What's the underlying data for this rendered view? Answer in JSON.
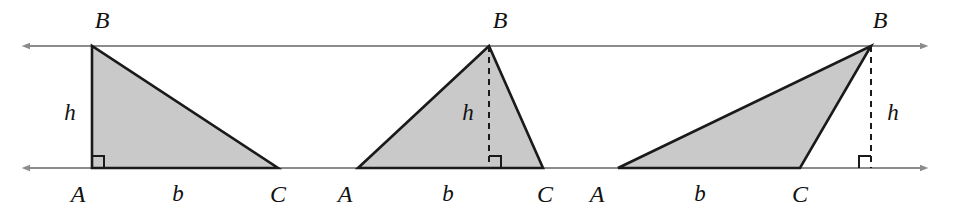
{
  "figure": {
    "width": 967,
    "height": 224,
    "background_color": "#ffffff",
    "parallel_lines": {
      "stroke_color": "#8c8c8c",
      "stroke_width": 2.2,
      "arrow_both_ends": true,
      "top_line_y": 46,
      "bottom_line_y": 168,
      "x_start": 30,
      "x_end": 920
    },
    "triangle_style": {
      "fill_color": "#c9c9c9",
      "stroke_color": "#1a1a1a",
      "stroke_width": 2.6,
      "altitude_dash_color": "#1a1a1a",
      "right_angle_marker_color": "#1a1a1a"
    },
    "triangles": [
      {
        "name": "right-triangle",
        "description": "altitude coincides with side AB, right angle at A",
        "points": "92,168 92,46 278,168",
        "vertices": {
          "A": [
            92,
            168
          ],
          "B": [
            92,
            46
          ],
          "C": [
            278,
            168
          ]
        },
        "altitude": {
          "from": [
            92,
            46
          ],
          "to": [
            92,
            168
          ],
          "dashed": false
        },
        "right_angle_at": [
          92,
          168
        ],
        "labels": {
          "apex": "B",
          "apex_pos": [
            102,
            20
          ],
          "left_base": "A",
          "left_base_pos": [
            78,
            194
          ],
          "base": "b",
          "base_pos": [
            178,
            193
          ],
          "right_base": "C",
          "right_base_pos": [
            278,
            194
          ],
          "height": "h",
          "height_pos": [
            70,
            112
          ]
        }
      },
      {
        "name": "acute-triangle",
        "description": "altitude falls inside the triangle, drawn dashed from B to base AC",
        "points": "358,168 489,46 543,168",
        "vertices": {
          "A": [
            358,
            168
          ],
          "B": [
            489,
            46
          ],
          "C": [
            543,
            168
          ]
        },
        "altitude": {
          "from": [
            489,
            46
          ],
          "to": [
            489,
            168
          ],
          "dashed": true
        },
        "right_angle_at": [
          489,
          168
        ],
        "labels": {
          "apex": "B",
          "apex_pos": [
            500,
            20
          ],
          "left_base": "A",
          "left_base_pos": [
            345,
            194
          ],
          "base": "b",
          "base_pos": [
            448,
            193
          ],
          "right_base": "C",
          "right_base_pos": [
            545,
            194
          ],
          "height": "h",
          "height_pos": [
            468,
            112
          ]
        }
      },
      {
        "name": "obtuse-triangle",
        "description": "altitude falls outside the triangle, dashed from B down to the extension of base AC",
        "points": "618,168 871,46 800,168",
        "vertices": {
          "A": [
            618,
            168
          ],
          "B": [
            871,
            46
          ],
          "C": [
            800,
            168
          ]
        },
        "altitude": {
          "from": [
            871,
            46
          ],
          "to": [
            871,
            168
          ],
          "dashed": true
        },
        "right_angle_at": [
          871,
          168
        ],
        "labels": {
          "apex": "B",
          "apex_pos": [
            880,
            20
          ],
          "left_base": "A",
          "left_base_pos": [
            597,
            194
          ],
          "base": "b",
          "base_pos": [
            700,
            193
          ],
          "right_base": "C",
          "right_base_pos": [
            800,
            194
          ],
          "height": "h",
          "height_pos": [
            893,
            112
          ]
        }
      }
    ]
  }
}
